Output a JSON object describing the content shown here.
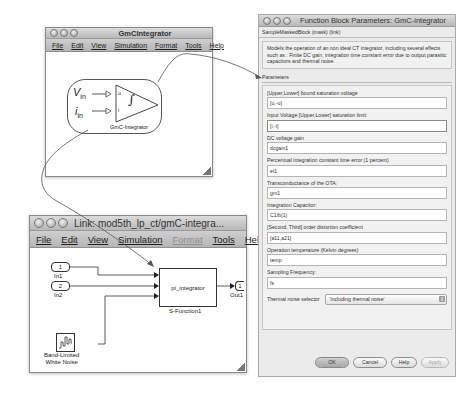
{
  "window1": {
    "title": "GmCIntegrator",
    "menu": [
      "File",
      "Edit",
      "View",
      "Simulation",
      "Format",
      "Tools",
      "Help"
    ],
    "block": {
      "input1": "V",
      "input1_sub": "in",
      "input2": "i",
      "input2_sub": "in",
      "port1": "u",
      "port2": "i",
      "symbol": "∫",
      "label": "GmC-Integrator"
    }
  },
  "window2": {
    "title": "Link: mod5th_lp_ct/gmC-integra...",
    "menu": [
      {
        "label": "File",
        "enabled": true
      },
      {
        "label": "Edit",
        "enabled": true
      },
      {
        "label": "View",
        "enabled": true
      },
      {
        "label": "Simulation",
        "enabled": true
      },
      {
        "label": "Format",
        "enabled": false
      },
      {
        "label": "Tools",
        "enabled": true
      },
      {
        "label": "Help",
        "enabled": true
      }
    ],
    "blocks": {
      "in1": {
        "number": "1",
        "label": "In1"
      },
      "in2": {
        "number": "2",
        "label": "In2"
      },
      "out1": {
        "number": "1",
        "label": "Out1"
      },
      "sfunction": {
        "name": "pi_integrator",
        "label": "S-Function1"
      },
      "noise": {
        "label_line1": "Band-Limited",
        "label_line2": "White Noise"
      }
    }
  },
  "dialog": {
    "title": "Function Block Parameters: GmC-integrator",
    "header": "SampleMaskedBlock (mask) (link)",
    "description": "Models the operation of an non ideal CT integrator, including several effects such as : Finite DC gain, integration time constant error due to output parasitic capacitors and thermal noise.",
    "parameters_label": "Parameters",
    "fields": [
      {
        "label": "[Upper,Lower] bound saturation voltage",
        "value": "[u,-u]",
        "focused": false
      },
      {
        "label": "Input Voltage [Upper,Lower] saturation limit:",
        "value": "[i,-i]",
        "focused": true
      },
      {
        "label": "DC voltage gain",
        "value": "dcgain1",
        "focused": false
      },
      {
        "label": "Percentual integration constant time error (1 percent)",
        "value": "et1",
        "focused": false
      },
      {
        "label": "Transconductance of the OTA:",
        "value": "gm1",
        "focused": false
      },
      {
        "label": "Integration Capacitor:",
        "value": "C1/b(1)",
        "focused": false
      },
      {
        "label": "[Second, Third] order distortion coefficient",
        "value": "[a11,a21]",
        "focused": false
      },
      {
        "label": "Operation temperature (Kelvin degrees)",
        "value": "temp",
        "focused": false
      },
      {
        "label": "Sampling Frequency:",
        "value": "fs",
        "focused": false
      }
    ],
    "select": {
      "label": "Thermal noise selector",
      "value": "'including thermal noise'"
    },
    "buttons": {
      "ok": "OK",
      "cancel": "Cancel",
      "help": "Help",
      "apply": "Apply"
    }
  }
}
